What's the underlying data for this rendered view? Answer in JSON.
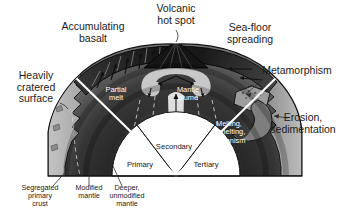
{
  "figure": {
    "title_alt": "Planetary evolution cross-section diagram",
    "background_color": "#ffffff",
    "ink_color": "#1a1a1a"
  },
  "outer_labels": [
    {
      "id": "volcanic-hot-spot",
      "lines": [
        "Volcanic",
        "hot spot"
      ],
      "x": 176,
      "y": 12
    },
    {
      "id": "accumulating-basalt",
      "lines": [
        "Accumulating",
        "basalt"
      ],
      "x": 93,
      "y": 30
    },
    {
      "id": "sea-floor-spreading",
      "lines": [
        "Sea-floor",
        "spreading"
      ],
      "x": 250,
      "y": 31
    },
    {
      "id": "metamorphism",
      "lines": [
        "Metamorphism"
      ],
      "x": 297,
      "y": 74
    },
    {
      "id": "erosion-sedimentation",
      "lines": [
        "Erosion,",
        "sedimentation"
      ],
      "x": 303,
      "y": 121
    },
    {
      "id": "heavily-cratered-surface",
      "lines": [
        "Heavily",
        "cratered",
        "surface"
      ],
      "x": 36,
      "y": 79
    }
  ],
  "inner_labels": [
    {
      "id": "partial-melt",
      "lines": [
        "Partial",
        "melt"
      ],
      "x": 116,
      "y": 92,
      "color": "#ffffff"
    },
    {
      "id": "mantle-plume",
      "lines": [
        "Mantle",
        "plume"
      ],
      "x": 188,
      "y": 92,
      "color": "#ffffff"
    },
    {
      "id": "melting-remelting-volcanism",
      "lines": [
        "Melting,",
        "remelting,",
        "volcanism"
      ],
      "x": 229,
      "y": 126,
      "color": "#ffffff"
    }
  ],
  "sector_labels": [
    {
      "id": "primary",
      "text": "Primary",
      "x": 140,
      "y": 167
    },
    {
      "id": "secondary",
      "text": "Secondary",
      "x": 174,
      "y": 149
    },
    {
      "id": "tertiary",
      "text": "Tertiary",
      "x": 206,
      "y": 167
    }
  ],
  "bottom_labels": [
    {
      "id": "segregated-primary-crust",
      "lines": [
        "Segregated",
        "primary",
        "crust"
      ],
      "x": 40,
      "y": 190,
      "leader_from_x": 53,
      "leader_from_y": 186,
      "leader_to_x": 68,
      "leader_to_y": 169
    },
    {
      "id": "modified-mantle",
      "lines": [
        "Modified",
        "mantle"
      ],
      "x": 89,
      "y": 190,
      "leader_from_x": 89,
      "leader_from_y": 186,
      "leader_to_x": 89,
      "leader_to_y": 167
    },
    {
      "id": "deeper-unmodified-mantle",
      "lines": [
        "Deeper,",
        "unmodified",
        "mantle"
      ],
      "x": 127,
      "y": 190,
      "leader_from_x": 122,
      "leader_from_y": 186,
      "leader_to_x": 113,
      "leader_to_y": 166
    }
  ],
  "colors": {
    "label_text": "#1a1a1a",
    "inner_text": "#ffffff",
    "divider": "#ffffff",
    "outline": "#111111",
    "crust_light": "#b5b5b5",
    "mantle_dark": "#1b1b1b",
    "mantle_mid": "#4a4a4a",
    "sector_fill": "#ffffff",
    "plume_light": "#e8e8e8"
  },
  "geometry": {
    "base_y": 176,
    "left_x": 48,
    "right_x": 302,
    "apex_x": 176,
    "apex_y": 44
  }
}
